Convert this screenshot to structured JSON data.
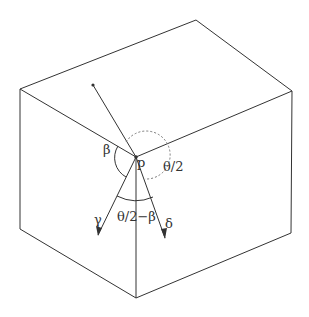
{
  "diagram": {
    "labels": {
      "beta": "β",
      "p": "p",
      "theta_half": "θ/2",
      "gamma": "γ",
      "theta_half_minus_beta": "θ/2−β",
      "delta": "δ"
    },
    "colors": {
      "stroke": "#333333",
      "dashed": "#777777",
      "background": "#ffffff"
    }
  }
}
